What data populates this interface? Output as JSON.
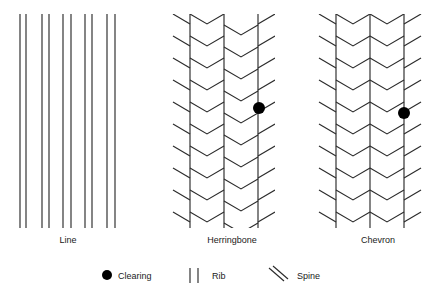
{
  "figure": {
    "title": "",
    "background_color": "#ffffff",
    "line_color": "#2b2b2b",
    "clearing_color": "#000000",
    "width": 439,
    "height": 302
  },
  "panels": [
    {
      "id": "line",
      "label": "Line",
      "label_x": 68,
      "label_y": 243,
      "pattern_type": "line",
      "bounds": {
        "x": 18,
        "y": 14,
        "width": 100,
        "height": 214
      },
      "rib_pairs_x": [
        [
          20,
          26
        ],
        [
          42,
          49
        ],
        [
          63,
          71
        ],
        [
          85,
          92
        ],
        [
          107,
          115
        ]
      ],
      "clearings": []
    },
    {
      "id": "herringbone",
      "label": "Herringbone",
      "label_x": 232,
      "label_y": 243,
      "pattern_type": "herringbone",
      "bounds": {
        "x": 173,
        "y": 14,
        "width": 100,
        "height": 214
      },
      "rib_x": [
        190,
        224,
        258
      ],
      "column_offsets": [
        0,
        11,
        0,
        11
      ],
      "chevron_period": 22,
      "clearings": [
        {
          "x": 259,
          "y": 108,
          "r": 6
        }
      ]
    },
    {
      "id": "chevron",
      "label": "Chevron",
      "label_x": 378,
      "label_y": 243,
      "pattern_type": "chevron",
      "bounds": {
        "x": 320,
        "y": 14,
        "width": 100,
        "height": 214
      },
      "rib_x": [
        336,
        370,
        404
      ],
      "column_offsets": [
        0,
        0,
        0,
        0
      ],
      "chevron_period": 22,
      "clearings": [
        {
          "x": 404,
          "y": 113,
          "r": 6
        }
      ]
    }
  ],
  "legend": {
    "y": 278,
    "items": [
      {
        "id": "clearing",
        "label": "Clearing",
        "symbol": "filled-circle-icon",
        "symbol_x": 107,
        "label_x": 118
      },
      {
        "id": "rib",
        "label": "Rib",
        "symbol": "double-vertical-line-icon",
        "symbol_x": 193,
        "label_x": 212
      },
      {
        "id": "spine",
        "label": "Spine",
        "symbol": "double-diagonal-line-icon",
        "symbol_x": 275,
        "label_x": 297
      }
    ]
  }
}
